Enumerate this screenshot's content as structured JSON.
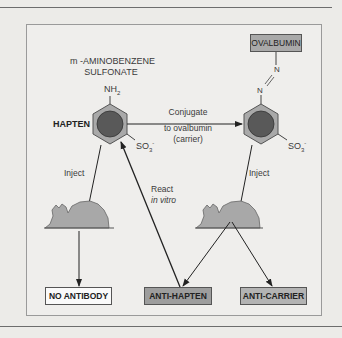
{
  "diagram": {
    "type": "hapten-carrier immunization flow",
    "compound_label_line1": "m -AMINOBENZENE",
    "compound_label_line2": "SULFONATE",
    "hapten_label": "HAPTEN",
    "amine_group": "NH",
    "amine_subscript": "2",
    "sulfonate_group_left": "SO",
    "sulfonate_group_right": "SO",
    "sulfonate_subscript": "3",
    "sulfonate_superscript": "-",
    "azo_n_top": "N",
    "azo_n_bottom": "N",
    "carrier_box": "OVALBUMIN",
    "conjugate_label_line1": "Conjugate",
    "conjugate_label_line2": "to ovalbumin",
    "conjugate_label_line3": "(carrier)",
    "inject_left": "Inject",
    "inject_right": "Inject",
    "react_label": "React",
    "react_sublabel": "in vitro",
    "outcomes": {
      "no_antibody": "NO ANTIBODY",
      "anti_hapten": "ANTI-HAPTEN",
      "anti_carrier": "ANTI-CARRIER"
    },
    "colors": {
      "ring_outer": "#a9a9a9",
      "ring_inner": "#595959",
      "mouse": "#a8a8a8",
      "box_dark": "#9d9d9d",
      "box_white": "#fafafa",
      "line": "#222222",
      "background": "#ecebe8"
    }
  }
}
